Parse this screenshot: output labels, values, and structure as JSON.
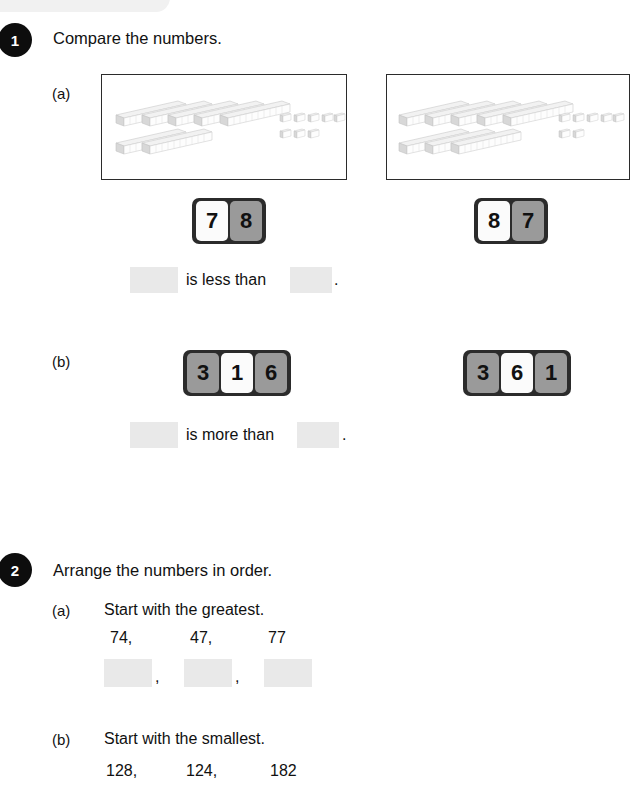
{
  "page": {
    "background_color": "#ffffff",
    "accent_color": "#0d0d0d",
    "blank_fill_color": "#e9e9e9",
    "tile_grey_color": "#9a9a9a",
    "tile_white_color": "#fbfbfb"
  },
  "questions": [
    {
      "number": "1",
      "title": "Compare the numbers.",
      "parts": [
        {
          "label": "(a)",
          "left_panel": {
            "name": "base-ten-blocks-78",
            "tens": 7,
            "ones": 8,
            "value": 78,
            "tens_rows": [
              5,
              2
            ],
            "ones_rows": [
              5,
              3
            ]
          },
          "right_panel": {
            "name": "base-ten-blocks-87",
            "tens": 8,
            "ones": 7,
            "value": 87,
            "tens_rows": [
              5,
              3
            ],
            "ones_rows": [
              5,
              2
            ]
          },
          "left_tiles": [
            {
              "digit": "7",
              "style": "white"
            },
            {
              "digit": "8",
              "style": "grey"
            }
          ],
          "right_tiles": [
            {
              "digit": "8",
              "style": "white"
            },
            {
              "digit": "7",
              "style": "grey"
            }
          ],
          "sentence": "is less than",
          "period": ".",
          "blank_1": "",
          "blank_2": ""
        },
        {
          "label": "(b)",
          "left_tiles": [
            {
              "digit": "3",
              "style": "grey"
            },
            {
              "digit": "1",
              "style": "white"
            },
            {
              "digit": "6",
              "style": "grey"
            }
          ],
          "right_tiles": [
            {
              "digit": "3",
              "style": "grey"
            },
            {
              "digit": "6",
              "style": "white"
            },
            {
              "digit": "1",
              "style": "grey"
            }
          ],
          "sentence": "is more than",
          "period": ".",
          "blank_1": "",
          "blank_2": ""
        }
      ]
    },
    {
      "number": "2",
      "title": "Arrange the numbers in order.",
      "parts": [
        {
          "label": "(a)",
          "instruction": "Start with the greatest.",
          "numbers": [
            "74,",
            "47,",
            "77"
          ],
          "answer_blanks": [
            "",
            "",
            ""
          ],
          "separators": [
            ",",
            ","
          ]
        },
        {
          "label": "(b)",
          "instruction": "Start with the smallest.",
          "numbers": [
            "128,",
            "124,",
            "182"
          ],
          "answer_blanks": [
            "",
            "",
            ""
          ],
          "separators": [
            ",",
            ","
          ]
        }
      ]
    }
  ]
}
